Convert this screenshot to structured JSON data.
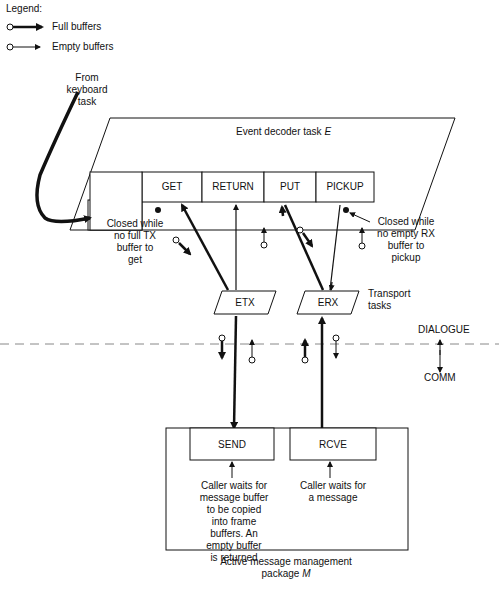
{
  "legend": {
    "title": "Legend:",
    "items": [
      {
        "label": "Full buffers",
        "symbol": "filled-arrow-with-open-circle"
      },
      {
        "label": "Empty buffers",
        "symbol": "open-arrow-with-open-circle"
      }
    ]
  },
  "keyboard_source": {
    "line1": "From",
    "line2": "keyboard",
    "line3": "task"
  },
  "event_decoder": {
    "title": "Event decoder task",
    "symbol": "E",
    "slots": [
      "",
      "GET",
      "RETURN",
      "PUT",
      "PICKUP"
    ]
  },
  "annotations": {
    "get_closed": [
      "Closed while",
      "no full TX",
      "buffer to",
      "get"
    ],
    "pickup_closed": [
      "Closed while",
      "no empty RX",
      "buffer to",
      "pickup"
    ],
    "send_note": [
      "Caller waits for",
      "message buffer",
      "to be copied",
      "into frame",
      "buffers. An",
      "empty buffer",
      "is returned"
    ],
    "rcve_note": [
      "Caller waits for",
      "a message"
    ]
  },
  "transport": {
    "etx": "ETX",
    "erx": "ERX",
    "label_line1": "Transport",
    "label_line2": "tasks"
  },
  "layers": {
    "upper": "DIALOGUE",
    "lower": "COMM"
  },
  "message_package": {
    "send": "SEND",
    "rcve": "RCVE",
    "title_line1": "Active message management",
    "title_line2": "package",
    "symbol": "M"
  }
}
